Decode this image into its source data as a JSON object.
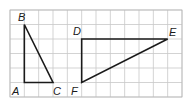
{
  "diagram": {
    "type": "grid-triangles",
    "grid": {
      "columns": 12,
      "rows": 6,
      "line_color": "#c8c8c8"
    },
    "triangles": [
      {
        "name": "ABC",
        "vertices": [
          {
            "label": "A",
            "col": 1,
            "row": 5
          },
          {
            "label": "B",
            "col": 1,
            "row": 1
          },
          {
            "label": "C",
            "col": 3,
            "row": 5
          }
        ]
      },
      {
        "name": "DEF",
        "vertices": [
          {
            "label": "D",
            "col": 5,
            "row": 2
          },
          {
            "label": "E",
            "col": 11,
            "row": 2
          },
          {
            "label": "F",
            "col": 5,
            "row": 5
          }
        ]
      }
    ],
    "labels": {
      "A": "A",
      "B": "B",
      "C": "C",
      "D": "D",
      "E": "E",
      "F": "F"
    },
    "stroke_color": "#1a1a1a"
  }
}
